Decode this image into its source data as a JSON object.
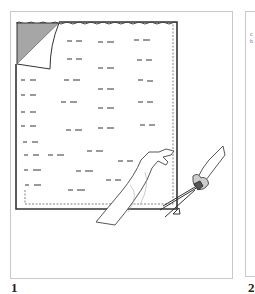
{
  "figure": {
    "panels": [
      {
        "label": "1",
        "description": "Sheet of labeled pattern tissue with corner peeled back; one hand holds the sheet while the other cuts along the dashed line with scissors",
        "elements": [
          "paper-sheet",
          "peeled-corner",
          "dashed-cut-line",
          "pattern-marks",
          "holding-hand",
          "scissors-hand",
          "scissors",
          "triangle-notch-mark"
        ]
      },
      {
        "label": "2",
        "partial_text": "c\nb"
      }
    ],
    "colors": {
      "panel_border": "#c9c9c9",
      "sheet_outline": "#333333",
      "corner_fill": "#a6a6a6",
      "marks": "#555555",
      "label": "#222222"
    }
  }
}
